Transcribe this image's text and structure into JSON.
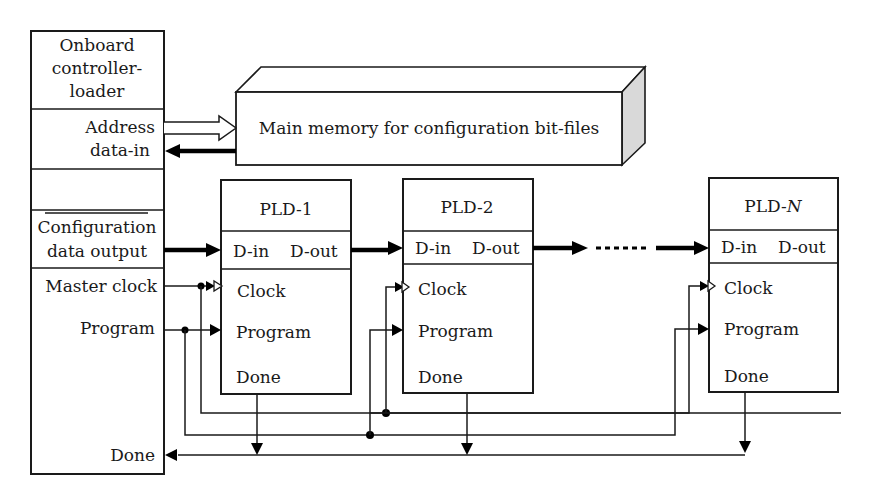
{
  "controller": {
    "title_lines": [
      "Onboard",
      "controller-",
      "loader"
    ],
    "address_label": "Address",
    "data_in_label": "data-in",
    "config_lines": [
      "Configuration",
      "data output"
    ],
    "master_clock_label": "Master clock",
    "program_label": "Program",
    "done_label": "Done"
  },
  "memory": {
    "label": "Main memory for configuration bit-files"
  },
  "plds": [
    {
      "title": "PLD-1",
      "title_suffix": "",
      "din": "D-in",
      "dout": "D-out",
      "clock": "Clock",
      "program": "Program",
      "done": "Done"
    },
    {
      "title": "PLD-2",
      "title_suffix": "",
      "din": "D-in",
      "dout": "D-out",
      "clock": "Clock",
      "program": "Program",
      "done": "Done"
    },
    {
      "title": "PLD-",
      "title_suffix": "N",
      "din": "D-in",
      "dout": "D-out",
      "clock": "Clock",
      "program": "Program",
      "done": "Done"
    }
  ],
  "colors": {
    "line": "#1a1a1a",
    "background": "#ffffff",
    "memory_side_shade": "#d9d9d9"
  }
}
